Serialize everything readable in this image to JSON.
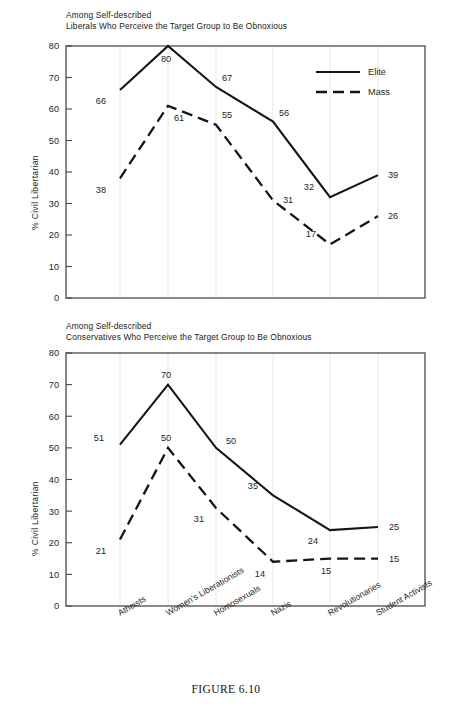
{
  "caption": "FIGURE 6.10",
  "axis": {
    "ylabel": "% Civil Libertarian",
    "yticks": [
      "80",
      "70",
      "60",
      "50",
      "40",
      "30",
      "20",
      "10",
      "0"
    ],
    "categories": [
      "Atheists",
      "Women's Liberationists",
      "Homosexuals",
      "Nazis",
      "Revolutionaries",
      "Student Activists"
    ]
  },
  "legend": {
    "elite_label": "Elite",
    "mass_label": "Mass"
  },
  "top": {
    "title_line1": "Among Self-described",
    "title_line2": "Liberals Who Perceive the Target Group to Be Obnoxious"
  },
  "bottom": {
    "title_line1": "Among Self-described",
    "title_line2": "Conservatives Who Perceive the Target Group to Be Obnoxious"
  },
  "chart_data": [
    {
      "type": "line",
      "title": "Among Self-described Liberals Who Perceive the Target Group to Be Obnoxious",
      "xlabel": "",
      "ylabel": "% Civil Libertarian",
      "ylim": [
        0,
        80
      ],
      "yticks": [
        0,
        10,
        20,
        30,
        40,
        50,
        60,
        70,
        80
      ],
      "grid": "vertical",
      "legend_position": "top-right",
      "categories": [
        "Atheists",
        "Women's Liberationists",
        "Homosexuals",
        "Nazis",
        "Revolutionaries",
        "Student Activists"
      ],
      "series": [
        {
          "name": "Elite",
          "style": "solid",
          "values": [
            66,
            80,
            67,
            56,
            32,
            39
          ]
        },
        {
          "name": "Mass",
          "style": "dashed",
          "values": [
            38,
            61,
            55,
            31,
            17,
            26
          ]
        }
      ]
    },
    {
      "type": "line",
      "title": "Among Self-described Conservatives Who Perceive the Target Group to Be Obnoxious",
      "xlabel": "",
      "ylabel": "% Civil Libertarian",
      "ylim": [
        0,
        80
      ],
      "yticks": [
        0,
        10,
        20,
        30,
        40,
        50,
        60,
        70,
        80
      ],
      "grid": "vertical",
      "legend_position": "none",
      "categories": [
        "Atheists",
        "Women's Liberationists",
        "Homosexuals",
        "Nazis",
        "Revolutionaries",
        "Student Activists"
      ],
      "series": [
        {
          "name": "Elite",
          "style": "solid",
          "values": [
            51,
            70,
            50,
            35,
            24,
            25
          ]
        },
        {
          "name": "Mass",
          "style": "dashed",
          "values": [
            21,
            50,
            31,
            14,
            15,
            15
          ]
        }
      ]
    }
  ]
}
